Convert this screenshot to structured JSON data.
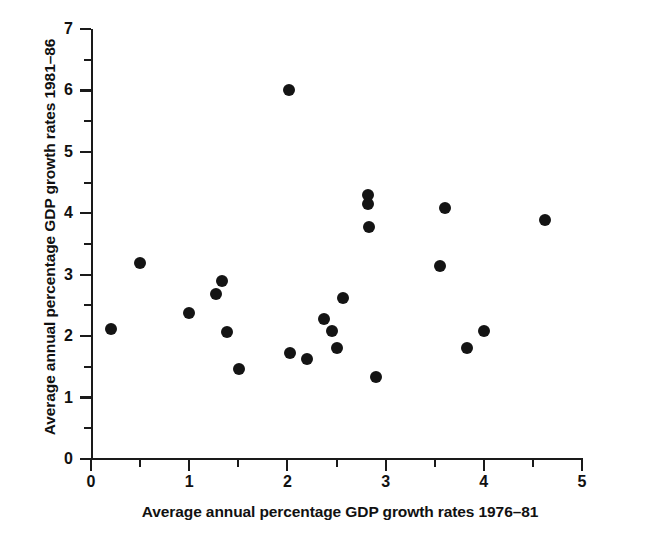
{
  "chart_data": {
    "type": "scatter",
    "title": "",
    "subtitle": "",
    "xlabel": "Average annual percentage GDP growth rates 1976–81",
    "ylabel": "Average annual percentage GDP growth rates 1981–86",
    "xlim": [
      0,
      5
    ],
    "ylim": [
      0,
      7
    ],
    "xticks": [
      0,
      1,
      2,
      3,
      4,
      5
    ],
    "xticklabels": [
      "0",
      "1",
      "2",
      "3",
      "4",
      "5"
    ],
    "xminorticks": [
      0.5,
      1.5,
      2.5,
      3.5,
      4.5
    ],
    "yticks": [
      0,
      1,
      2,
      3,
      4,
      5,
      6,
      7
    ],
    "yticklabels": [
      "0",
      "1",
      "2",
      "3",
      "4",
      "5",
      "6",
      "7"
    ],
    "yminorticks": [
      0.5,
      1.5,
      2.5,
      3.5,
      4.5,
      5.5,
      6.5
    ],
    "grid": false,
    "legend": null,
    "legend_position": "none",
    "marker": "filled-circle",
    "marker_color": "#141414",
    "marker_size": 12,
    "n_points": 25,
    "points": [
      {
        "x": 0.2,
        "y": 2.12
      },
      {
        "x": 0.5,
        "y": 3.19
      },
      {
        "x": 1.0,
        "y": 2.38
      },
      {
        "x": 1.27,
        "y": 2.69
      },
      {
        "x": 1.33,
        "y": 2.9
      },
      {
        "x": 1.38,
        "y": 2.07
      },
      {
        "x": 1.51,
        "y": 1.47
      },
      {
        "x": 2.02,
        "y": 6.0
      },
      {
        "x": 2.03,
        "y": 1.72
      },
      {
        "x": 2.2,
        "y": 1.63
      },
      {
        "x": 2.37,
        "y": 2.28
      },
      {
        "x": 2.45,
        "y": 2.08
      },
      {
        "x": 2.5,
        "y": 1.8
      },
      {
        "x": 2.57,
        "y": 2.62
      },
      {
        "x": 2.82,
        "y": 4.3
      },
      {
        "x": 2.82,
        "y": 4.15
      },
      {
        "x": 2.83,
        "y": 3.77
      },
      {
        "x": 2.9,
        "y": 1.33
      },
      {
        "x": 3.55,
        "y": 3.14
      },
      {
        "x": 3.6,
        "y": 4.08
      },
      {
        "x": 3.83,
        "y": 1.81
      },
      {
        "x": 4.0,
        "y": 2.08
      },
      {
        "x": 4.62,
        "y": 3.89
      }
    ]
  },
  "axes": {
    "x_title": "Average annual percentage GDP growth rates 1976–81",
    "y_title": "Average annual percentage GDP growth rates 1981–86",
    "x_tick_labels": [
      "0",
      "1",
      "2",
      "3",
      "4",
      "5"
    ],
    "y_tick_labels": [
      "0",
      "1",
      "2",
      "3",
      "4",
      "5",
      "6",
      "7"
    ],
    "axis_color": "#1a1a1a"
  }
}
